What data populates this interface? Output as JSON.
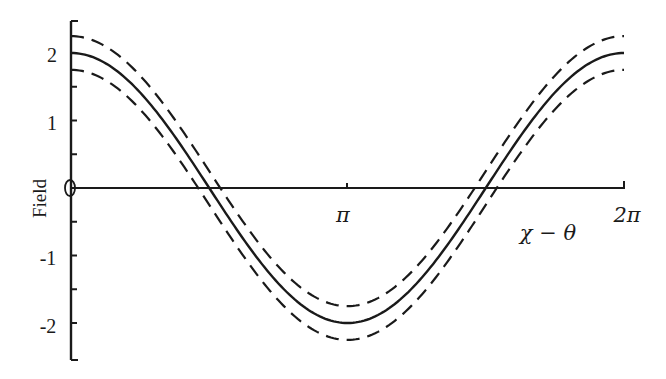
{
  "chart_data": {
    "type": "line",
    "title": "",
    "xlabel": "χ − θ",
    "ylabel": "Field",
    "xlim": [
      0,
      6.2832
    ],
    "ylim": [
      -2.5,
      2.5
    ],
    "grid": false,
    "legend": null,
    "x_ticks": [
      {
        "value": 3.1416,
        "label": "π"
      },
      {
        "value": 6.2832,
        "label": "2π"
      }
    ],
    "y_ticks": [
      {
        "value": 2,
        "label": "2"
      },
      {
        "value": 1,
        "label": "1"
      },
      {
        "value": 0,
        "label": "0"
      },
      {
        "value": -1,
        "label": "-1"
      },
      {
        "value": -2,
        "label": "-2"
      }
    ],
    "y_minor_ticks": [
      2.5,
      1.5,
      0.5,
      -0.5,
      -1.5,
      -2.5
    ],
    "series": [
      {
        "name": "field",
        "style": "solid",
        "formula": "2cos(x)",
        "x": [
          0,
          0.785,
          1.571,
          2.356,
          3.142,
          3.927,
          4.712,
          5.498,
          6.283
        ],
        "values": [
          2.0,
          1.41,
          0.0,
          -1.41,
          -2.0,
          -1.41,
          0.0,
          1.41,
          2.0
        ]
      },
      {
        "name": "upper bound",
        "style": "dashed",
        "formula": "2cos(x)+0.25",
        "x": [
          0,
          0.785,
          1.571,
          2.356,
          3.142,
          3.927,
          4.712,
          5.498,
          6.283
        ],
        "values": [
          2.25,
          1.66,
          0.25,
          -1.16,
          -1.75,
          -1.16,
          0.25,
          1.66,
          2.25
        ]
      },
      {
        "name": "lower bound",
        "style": "dashed",
        "formula": "2cos(x)-0.25",
        "x": [
          0,
          0.785,
          1.571,
          2.356,
          3.142,
          3.927,
          4.712,
          5.498,
          6.283
        ],
        "values": [
          1.75,
          1.16,
          -0.25,
          -1.66,
          -2.25,
          -1.66,
          -0.25,
          1.16,
          1.75
        ]
      }
    ]
  },
  "layout": {
    "origin_x": 71,
    "origin_y": 188,
    "x_end": 624,
    "y_top": 21,
    "y_bottom": 360,
    "px_per_unit_y": 67.5,
    "colors": {
      "ink": "#1a1a1a",
      "background": "#ffffff"
    }
  },
  "labels": {
    "ylabel": "Field",
    "xlabel": "χ − θ",
    "pi": "π",
    "two_pi": "2π",
    "y2": "2",
    "y1": "1",
    "y0": "0",
    "ym1": "-1",
    "ym2": "-2"
  }
}
